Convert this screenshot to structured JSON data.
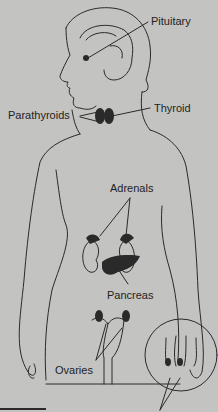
{
  "diagram": {
    "background_color": "#c3c3c1",
    "line_color": "#2a2a2a",
    "gland_color": "#2a2a2a",
    "labels": {
      "pituitary": "Pituitary",
      "thyroid": "Thyroid",
      "parathyroids": "Parathyroids",
      "adrenals": "Adrenals",
      "pancreas": "Pancreas",
      "ovaries": "Ovaries"
    }
  }
}
